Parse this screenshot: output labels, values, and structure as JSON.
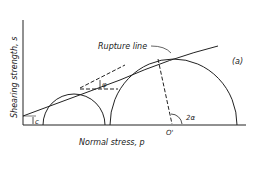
{
  "diagram": {
    "panel_label": "(a)",
    "rupture_label": "Rupture line",
    "y_axis_label": "Shearing strength, s",
    "x_axis_label": "Normal stress, p",
    "cohesion_label": "c",
    "friction_angle_label": "φ",
    "center_label": "O'",
    "angle_label": "2α"
  }
}
